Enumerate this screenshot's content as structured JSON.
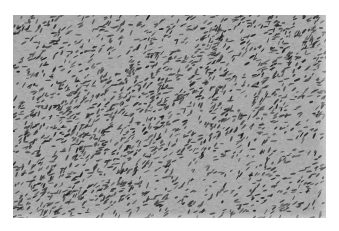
{
  "image": {
    "kind": "grayscale histology micrograph",
    "description": "Spindle-cell tissue with densely packed, elongated dark nuclei arranged in sweeping fascicles on a mid-gray stroma",
    "frame": {
      "x": 13,
      "y": 15,
      "width": 313,
      "height": 203
    },
    "colors": {
      "page_background": "#ffffff",
      "stroma": "#a9a9a9",
      "stroma_light": "#c4c4c4",
      "stroma_dark": "#8f8f8f",
      "nucleus": "#3a3a3a",
      "nucleus_dark": "#1e1e1e"
    },
    "texture": {
      "nuclei_count": 2600,
      "nucleus_length_range": [
        3,
        7
      ],
      "nucleus_width_range": [
        1,
        2
      ],
      "dominant_angle_deg": -35,
      "angle_jitter_deg": 35,
      "denser_band": "diagonal band from upper-right to center-left",
      "seed": 7
    }
  }
}
